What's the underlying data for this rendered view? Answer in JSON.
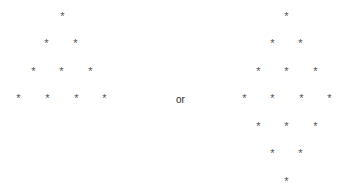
{
  "page": {
    "background_color": "#ffffff",
    "glyph_color": "#555558",
    "text_color": "#2b2b2e",
    "width": 347,
    "height": 195
  },
  "separator": {
    "label": "or"
  },
  "figures": [
    {
      "name": "left-triangle",
      "shape": "right-growing-triangle",
      "row_count": 4,
      "glyph": "*",
      "rows": [
        {
          "index": 0,
          "count": 1,
          "y": 11,
          "xs": [
            59
          ]
        },
        {
          "index": 1,
          "count": 2,
          "y": 38,
          "xs": [
            43,
            72
          ]
        },
        {
          "index": 2,
          "count": 3,
          "y": 66,
          "xs": [
            30,
            58,
            87
          ]
        },
        {
          "index": 3,
          "count": 4,
          "y": 93,
          "xs": [
            15,
            44,
            73,
            101
          ]
        }
      ]
    },
    {
      "name": "right-diamond",
      "shape": "diamond",
      "row_count": 7,
      "glyph": "*",
      "rows": [
        {
          "index": 0,
          "count": 1,
          "y": 11,
          "xs": [
            283
          ]
        },
        {
          "index": 1,
          "count": 2,
          "y": 38,
          "xs": [
            269,
            297
          ]
        },
        {
          "index": 2,
          "count": 3,
          "y": 66,
          "xs": [
            255,
            283,
            312
          ]
        },
        {
          "index": 3,
          "count": 4,
          "y": 93,
          "xs": [
            241,
            269,
            298,
            326
          ]
        },
        {
          "index": 4,
          "count": 3,
          "y": 121,
          "xs": [
            255,
            283,
            312
          ]
        },
        {
          "index": 5,
          "count": 2,
          "y": 148,
          "xs": [
            269,
            297
          ]
        },
        {
          "index": 6,
          "count": 1,
          "y": 176,
          "xs": [
            283
          ]
        }
      ]
    }
  ]
}
